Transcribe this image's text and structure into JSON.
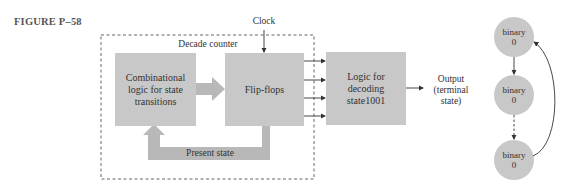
{
  "figure": {
    "label": "FIGURE P–58"
  },
  "diagram": {
    "clock_label": "Clock",
    "container_label": "Decade counter",
    "blocks": [
      {
        "id": "comb-logic",
        "lines": [
          "Combinational",
          "logic for state",
          "transitions"
        ]
      },
      {
        "id": "flip-flops",
        "lines": [
          "Flip-flops"
        ]
      },
      {
        "id": "decode-logic",
        "lines": [
          "Logic for",
          "decoding",
          "state1001"
        ]
      }
    ],
    "feedback_label": "Present state",
    "output_label": [
      "Output",
      "(terminal",
      "state)"
    ],
    "state_nodes": [
      {
        "line1": "binary",
        "line2": "0"
      },
      {
        "line1": "binary",
        "line2": "0"
      },
      {
        "line1": "binary",
        "line2": "0"
      }
    ],
    "colors": {
      "block_fill": "#c8c8c8",
      "arrow_fill": "#b8b8b8",
      "line": "#333333",
      "node_fill": "#c8c8c8"
    }
  }
}
